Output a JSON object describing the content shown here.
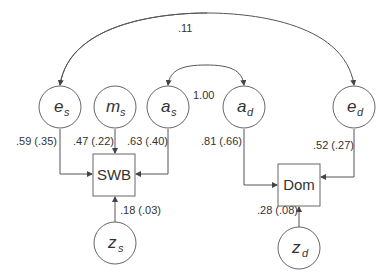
{
  "diagram": {
    "type": "path-diagram",
    "nodes": {
      "e_s": {
        "main": "e",
        "sub": "s",
        "shape": "circle"
      },
      "m_s": {
        "main": "m",
        "sub": "s",
        "shape": "circle"
      },
      "a_s": {
        "main": "a",
        "sub": "s",
        "shape": "circle"
      },
      "a_d": {
        "main": "a",
        "sub": "d",
        "shape": "circle"
      },
      "e_d": {
        "main": "e",
        "sub": "d",
        "shape": "circle"
      },
      "z_s": {
        "main": "z",
        "sub": "s",
        "shape": "circle"
      },
      "z_d": {
        "main": "z",
        "sub": "d",
        "shape": "circle"
      },
      "swb": {
        "label": "SWB",
        "shape": "box"
      },
      "dom": {
        "label": "Dom",
        "shape": "box"
      }
    },
    "edges": {
      "es_swb": {
        "from": "e_s",
        "to": "SWB",
        "label": ".59 (.35)"
      },
      "ms_swb": {
        "from": "m_s",
        "to": "SWB",
        "label": ".47 (.22)"
      },
      "as_swb": {
        "from": "a_s",
        "to": "SWB",
        "label": ".63 (.40)"
      },
      "zs_swb": {
        "from": "z_s",
        "to": "SWB",
        "label": ".18 (.03)"
      },
      "ad_dom": {
        "from": "a_d",
        "to": "Dom",
        "label": ".81 (.66)"
      },
      "ed_dom": {
        "from": "e_d",
        "to": "Dom",
        "label": ".52 (.27)"
      },
      "zd_dom": {
        "from": "z_d",
        "to": "Dom",
        "label": ".28 (.08)"
      },
      "es_ed": {
        "from": "e_s",
        "to": "e_d",
        "label": ".11",
        "type": "correlation"
      },
      "as_ad": {
        "from": "a_s",
        "to": "a_d",
        "label": "1.00",
        "type": "correlation"
      }
    }
  }
}
